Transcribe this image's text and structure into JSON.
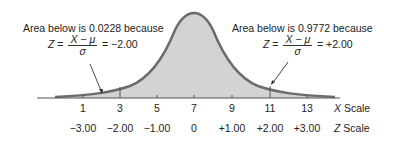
{
  "annotations": {
    "left": {
      "text": "Area below is 0.0228 because",
      "z_symbol": "Z",
      "equals": "=",
      "numerator": "X − μ",
      "denominator": "σ",
      "result": "= −2.00"
    },
    "right": {
      "text": "Area below is 0.9772 because",
      "z_symbol": "Z",
      "equals": "=",
      "numerator": "X − μ",
      "denominator": "σ",
      "result": "= +2.00"
    }
  },
  "x_scale": {
    "label_var": "X",
    "label_word": "Scale",
    "ticks": [
      "1",
      "3",
      "5",
      "7",
      "9",
      "11",
      "13"
    ]
  },
  "z_scale": {
    "label_var": "Z",
    "label_word": "Scale",
    "ticks": [
      "−3.00",
      "−2.00",
      "−1.00",
      "0",
      "+1.00",
      "+2.00",
      "+3.00"
    ]
  },
  "colors": {
    "curve": "#6b6b6b",
    "fill": "#d3d3d3",
    "axis": "#555555"
  }
}
